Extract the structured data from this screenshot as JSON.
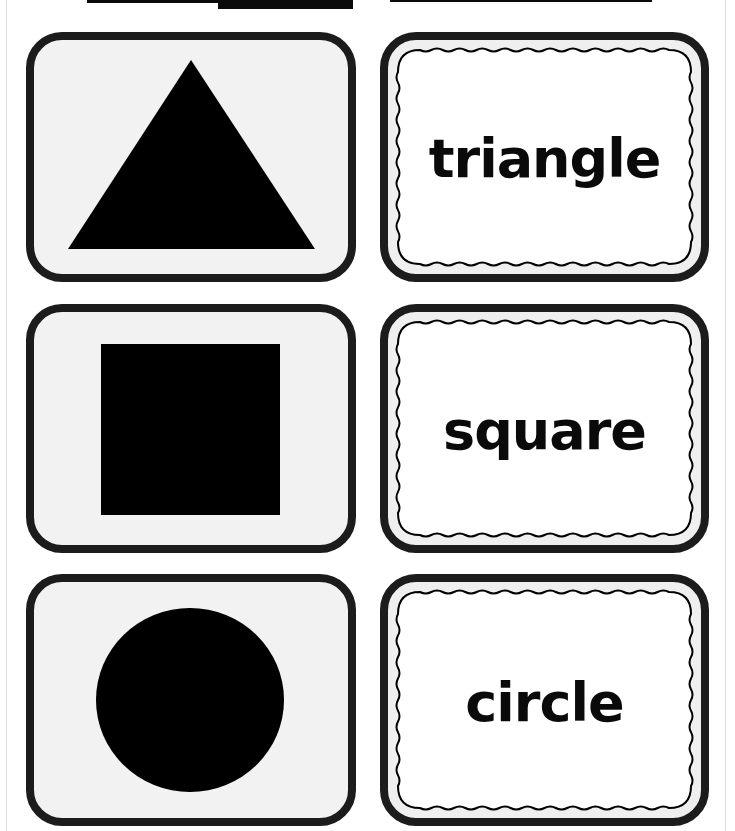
{
  "page": {
    "background": "#ffffff",
    "border_color": "#1c1c1c",
    "card_fill": "#f2f2f2",
    "shape_color": "#000000"
  },
  "top_fragments": [
    {
      "x": 87,
      "y": 0,
      "w": 131,
      "h": 3
    },
    {
      "x": 218,
      "y": 0,
      "w": 135,
      "h": 9
    },
    {
      "x": 390,
      "y": 0,
      "w": 262,
      "h": 2
    }
  ],
  "cards": [
    {
      "row": 1,
      "shape": "triangle",
      "word": "triangle"
    },
    {
      "row": 2,
      "shape": "square",
      "word": "square"
    },
    {
      "row": 3,
      "shape": "circle",
      "word": "circle"
    }
  ]
}
